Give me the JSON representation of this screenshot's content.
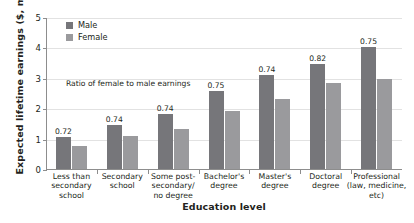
{
  "chart_data": {
    "type": "bar",
    "title": "",
    "xlabel": "Education level",
    "ylabel": "Expected lifetime earnings ($, millions)",
    "ylim": [
      0,
      5
    ],
    "yticks": [
      "0",
      "1",
      "2",
      "3",
      "4",
      "5"
    ],
    "grid": true,
    "legend_position": "top-left",
    "annotation": "Ratio of female to male earnings",
    "categories": [
      "Less than\nsecondary\nschool",
      "Secondary\nschool",
      "Some post-\nsecondary/\nno degree",
      "Bachelor's\ndegree",
      "Master's\ndegree",
      "Doctoral\ndegree",
      "Professional\n(law, medicine,\netc)"
    ],
    "category_labels": [
      [
        "Less than",
        "secondary",
        "school"
      ],
      [
        "Secondary",
        "school"
      ],
      [
        "Some post-",
        "secondary/",
        "no degree"
      ],
      [
        "Bachelor's",
        "degree"
      ],
      [
        "Master's",
        "degree"
      ],
      [
        "Doctoral",
        "degree"
      ],
      [
        "Professional",
        "(law, medicine,",
        "etc)"
      ]
    ],
    "series": [
      {
        "name": "Male",
        "color": "#76767a",
        "values": [
          1.05,
          1.45,
          1.8,
          2.55,
          3.1,
          3.45,
          4.0
        ]
      },
      {
        "name": "Female",
        "color": "#9a9a9d",
        "values": [
          0.76,
          1.08,
          1.33,
          1.92,
          2.3,
          2.82,
          2.95
        ]
      }
    ],
    "data_labels": [
      "0.72",
      "0.74",
      "0.74",
      "0.75",
      "0.74",
      "0.82",
      "0.75"
    ]
  }
}
